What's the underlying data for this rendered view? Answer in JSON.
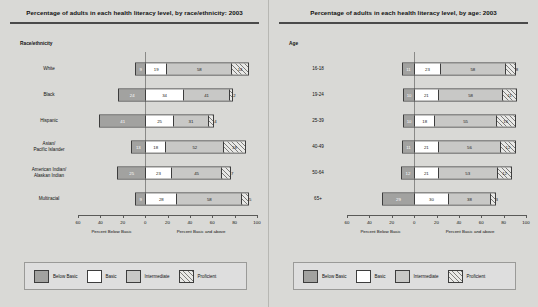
{
  "panels": [
    {
      "title": "Percentage of adults in each health literacy level, by race/ethnicity: 2003",
      "group_label": "Race/ethnicity"
    },
    {
      "title": "Percentage of adults in each health literacy level, by age: 2003",
      "group_label": "Age"
    }
  ],
  "axis": {
    "ticks": [
      "60",
      "40",
      "20",
      "0",
      "20",
      "40",
      "60",
      "80",
      "100"
    ],
    "tick_values": [
      -60,
      -40,
      -20,
      0,
      20,
      40,
      60,
      80,
      100
    ],
    "left_caption": "Percent Below Basic",
    "right_caption": "Percent Basic and above",
    "min": -60,
    "max": 100
  },
  "legend": {
    "items": [
      {
        "label": "Below Basic",
        "key": "below",
        "color": "#a2a2a0"
      },
      {
        "label": "Basic",
        "key": "basic",
        "color": "#ffffff"
      },
      {
        "label": "Intermediate",
        "key": "inter",
        "color": "#c8c8c6"
      },
      {
        "label": "Proficient",
        "key": "prof",
        "color": "#e8e8e6"
      }
    ]
  },
  "chart_data": {
    "type": "bar",
    "orientation": "horizontal",
    "stacked": true,
    "xlabel": "Percent",
    "ylabel": "",
    "xlim": [
      -60,
      100
    ],
    "grid": false,
    "legend_position": "bottom",
    "series": [
      {
        "name": "Below Basic",
        "key": "below"
      },
      {
        "name": "Basic",
        "key": "basic"
      },
      {
        "name": "Intermediate",
        "key": "inter"
      },
      {
        "name": "Proficient",
        "key": "prof"
      }
    ],
    "panels": [
      {
        "name": "race_ethnicity",
        "categories": [
          "White",
          "Black",
          "Hispanic",
          "Asian/\nPacific Islander",
          "American Indian/\nAlaskan Indian",
          "Multiracial"
        ],
        "rows": [
          {
            "label": "White",
            "below": 9,
            "basic": 19,
            "inter": 58,
            "prof": 14
          },
          {
            "label": "Black",
            "below": 24,
            "basic": 34,
            "inter": 41,
            "prof": 2
          },
          {
            "label": "Hispanic",
            "below": 41,
            "basic": 25,
            "inter": 31,
            "prof": 4
          },
          {
            "label": "Asian/ Pacific Islander",
            "below": 13,
            "basic": 18,
            "inter": 52,
            "prof": 18
          },
          {
            "label": "American Indian/ Alaskan Indian",
            "below": 25,
            "basic": 23,
            "inter": 45,
            "prof": 7
          },
          {
            "label": "Multiracial",
            "below": 9,
            "basic": 28,
            "inter": 58,
            "prof": 5
          }
        ]
      },
      {
        "name": "age",
        "categories": [
          "16-18",
          "19-24",
          "25-39",
          "40-49",
          "50-64",
          "65+"
        ],
        "rows": [
          {
            "label": "16-18",
            "below": 11,
            "basic": 23,
            "inter": 58,
            "prof": 8
          },
          {
            "label": "19-24",
            "below": 10,
            "basic": 21,
            "inter": 58,
            "prof": 11
          },
          {
            "label": "25-39",
            "below": 10,
            "basic": 18,
            "inter": 55,
            "prof": 16
          },
          {
            "label": "40-49",
            "below": 11,
            "basic": 21,
            "inter": 56,
            "prof": 12
          },
          {
            "label": "50-64",
            "below": 12,
            "basic": 21,
            "inter": 53,
            "prof": 12
          },
          {
            "label": "65+",
            "below": 29,
            "basic": 30,
            "inter": 38,
            "prof": 3
          }
        ]
      }
    ]
  }
}
